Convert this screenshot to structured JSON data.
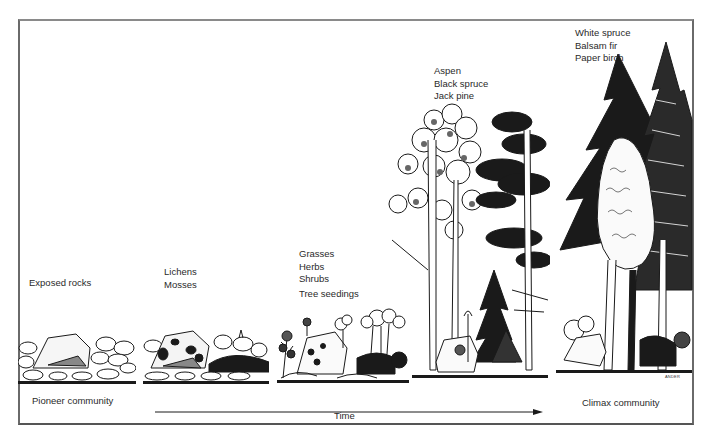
{
  "diagram": {
    "type": "ecological-succession-illustration",
    "stages": [
      {
        "id": "stage-1",
        "labels": [
          "Exposed rocks"
        ]
      },
      {
        "id": "stage-2",
        "labels": [
          "Lichens",
          "Mosses"
        ]
      },
      {
        "id": "stage-3",
        "labels": [
          "Grasses",
          "Herbs",
          "Shrubs",
          "Tree seedings"
        ]
      },
      {
        "id": "stage-4",
        "labels": [
          "Aspen",
          "Black spruce",
          "Jack pine"
        ]
      },
      {
        "id": "stage-5",
        "labels": [
          "White spruce",
          "Balsam fir",
          "Paper birch"
        ]
      }
    ],
    "axis": {
      "start_label": "Pioneer community",
      "middle_label": "Time",
      "end_label": "Climax community"
    },
    "signature": "ANDER"
  },
  "colors": {
    "ink": "#1a1a1a",
    "frame": "#6a6a6a",
    "background": "#ffffff"
  }
}
